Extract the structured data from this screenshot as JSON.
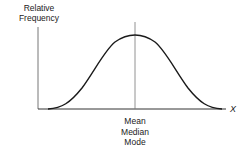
{
  "figure": {
    "y_axis_label_line1": "Relative",
    "y_axis_label_line2": "Frequency",
    "x_axis_label": "X",
    "center_labels": [
      "Mean",
      "Median",
      "Mode"
    ],
    "colors": {
      "line": "#222222",
      "axis": "#555555",
      "background": "#ffffff"
    }
  },
  "diagram": {
    "type": "normal-distribution-curve",
    "axes": {
      "x": "X",
      "y": "Relative Frequency"
    },
    "center_marker": "Mean = Median = Mode"
  }
}
